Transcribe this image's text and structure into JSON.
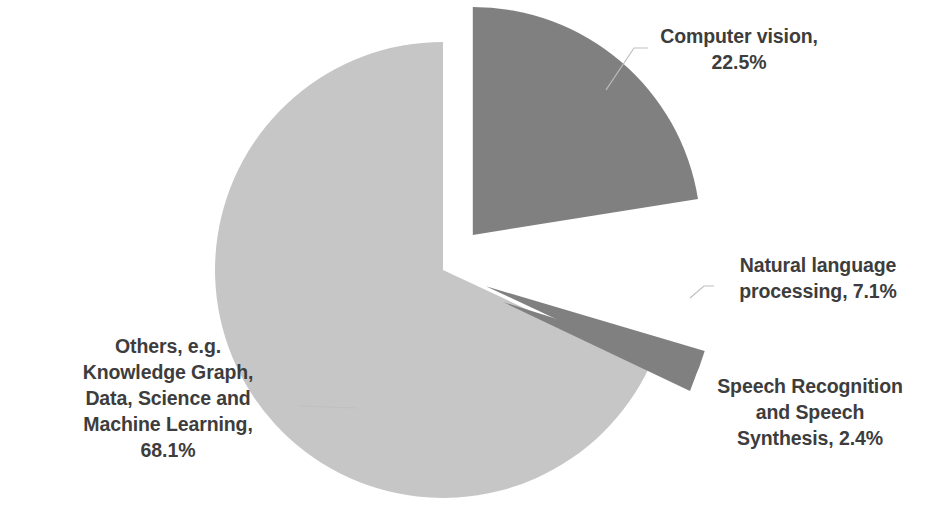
{
  "chart_data": {
    "type": "pie",
    "title": "",
    "subtitle": "",
    "xlabel": "",
    "ylabel": "",
    "legend_position": "none",
    "grid": false,
    "labels_inside": false,
    "start_angle_deg": 0,
    "direction": "clockwise",
    "categories": [
      "Computer vision",
      "Natural language processing",
      "Speech Recognition and Speech Synthesis",
      "Others, e.g. Knowledge Graph, Data, Science and Machine Learning"
    ],
    "values": [
      22.5,
      7.1,
      2.4,
      68.1
    ],
    "units": "percent",
    "slices": [
      {
        "name": "Computer vision",
        "value": 22.5,
        "value_text": "22.5%",
        "color": "#808080",
        "exploded": true,
        "label_text": "Computer vision,\n22.5%"
      },
      {
        "name": "Natural language processing",
        "value": 7.1,
        "value_text": "7.1%",
        "color": "#808080",
        "exploded": true,
        "label_text": "Natural language\nprocessing, 7.1%"
      },
      {
        "name": "Speech Recognition and Speech Synthesis",
        "value": 2.4,
        "value_text": "2.4%",
        "color": "#808080",
        "exploded": true,
        "label_text": "Speech Recognition\nand Speech\nSynthesis, 2.4%"
      },
      {
        "name": "Others, e.g. Knowledge Graph, Data, Science and Machine Learning",
        "value": 68.1,
        "value_text": "68.1%",
        "color": "#c6c6c6",
        "exploded": false,
        "label_text": "Others, e.g.\nKnowledge Graph,\nData, Science and\nMachine Learning,\n68.1%"
      }
    ],
    "colors": {
      "slice_dark": "#808080",
      "slice_light": "#c6c6c6",
      "background": "#ffffff",
      "label_text": "#3d3d3d",
      "leader_line": "#bfbfbf"
    }
  }
}
